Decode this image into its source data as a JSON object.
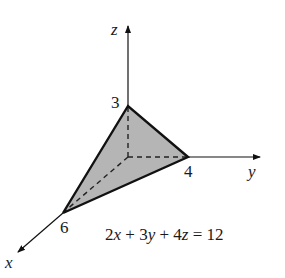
{
  "diagram": {
    "type": "3d-plane-intercepts",
    "axes": {
      "x": {
        "label": "x",
        "intercept_label": "6"
      },
      "y": {
        "label": "y",
        "intercept_label": "4"
      },
      "z": {
        "label": "z",
        "intercept_label": "3"
      }
    },
    "equation": {
      "lhs_terms": [
        "2",
        "x",
        " + 3",
        "y",
        " + 4",
        "z"
      ],
      "rhs": " = 12",
      "full": "2x + 3y + 4z = 12"
    },
    "colors": {
      "plane_fill": "#b5b5b5",
      "stroke": "#111111",
      "background": "#ffffff"
    }
  }
}
